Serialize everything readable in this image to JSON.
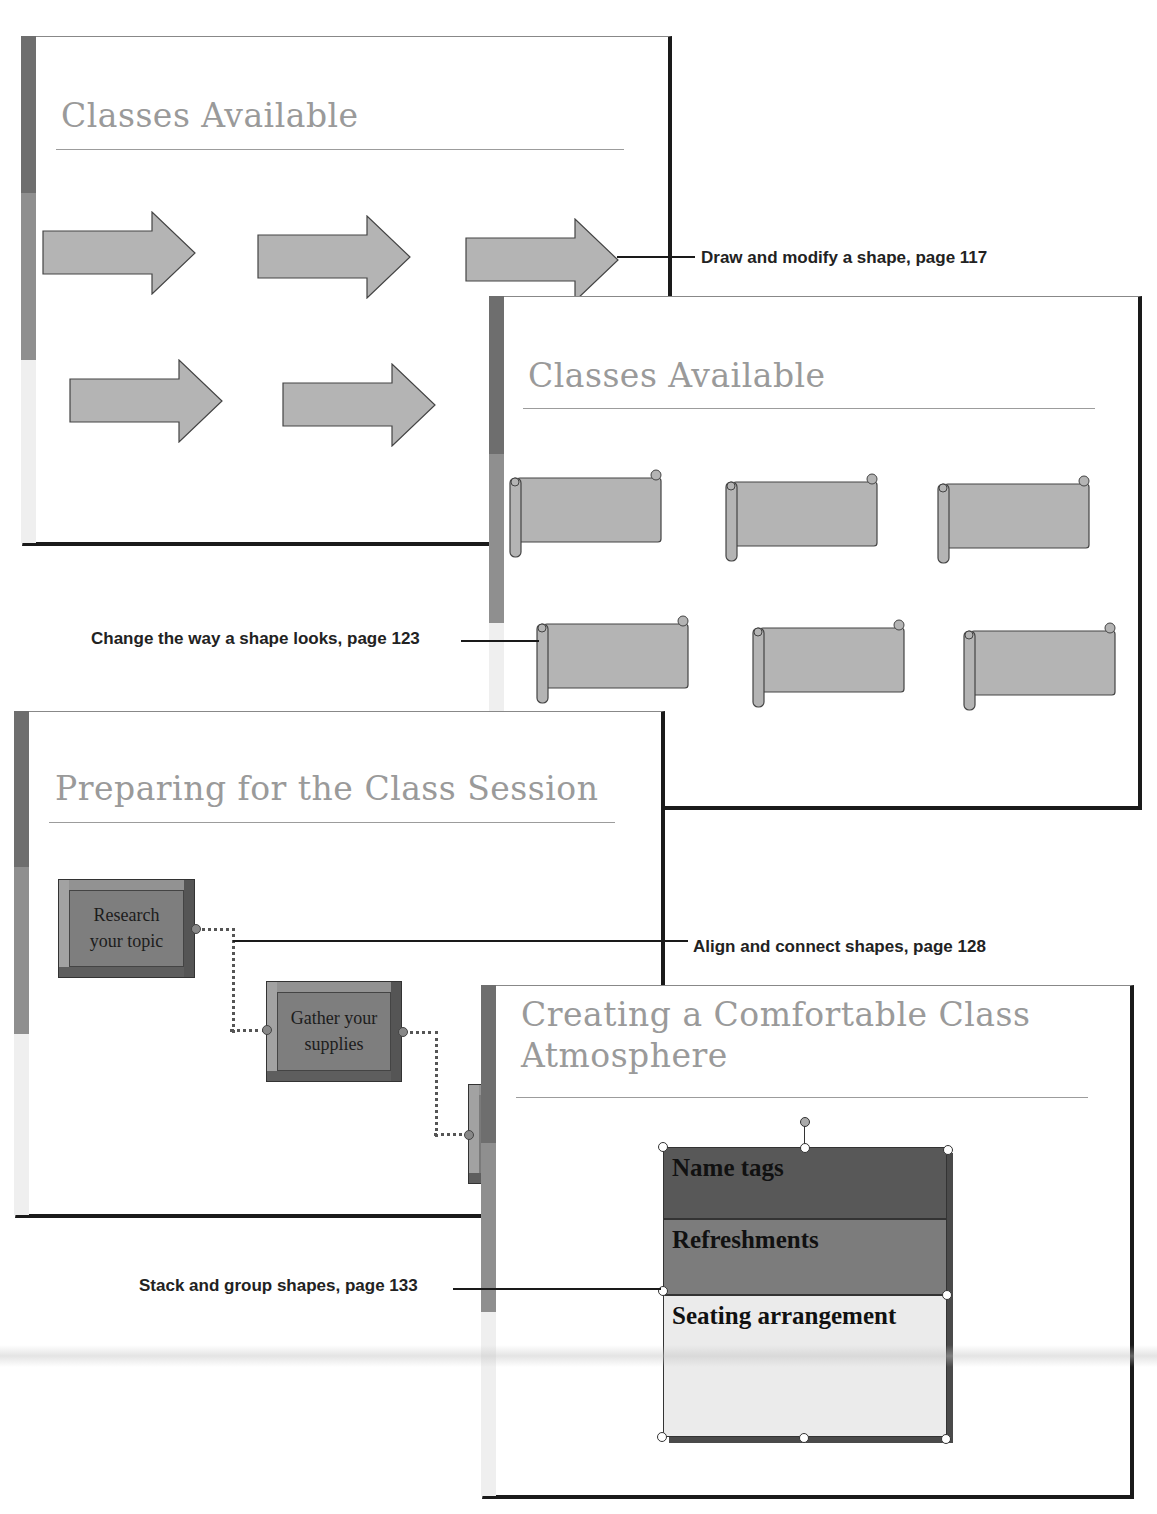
{
  "colors": {
    "accent_dark": "#6e6e6e",
    "accent_mid": "#8f8f8f",
    "accent_light": "#efefef",
    "shape_fill": "#b4b4b4",
    "title_text": "#9a9a9a",
    "group_row_1": "#585858",
    "group_row_2": "#7c7c7c",
    "group_row_3": "#ebebeb"
  },
  "slides": [
    {
      "id": "slide-arrows",
      "title": "Classes Available",
      "shape_type": "block-arrow",
      "shape_count": 5
    },
    {
      "id": "slide-scrolls",
      "title": "Classes Available",
      "shape_type": "horizontal-scroll",
      "shape_count": 6
    },
    {
      "id": "slide-flowchart",
      "title": "Preparing for the Class Session",
      "boxes": [
        {
          "label": "Research your topic"
        },
        {
          "label": "Gather your supplies"
        }
      ]
    },
    {
      "id": "slide-group",
      "title_line1": "Creating a Comfortable Class",
      "title_line2": "Atmosphere",
      "group_rows": [
        {
          "label": "Name tags"
        },
        {
          "label": "Refreshments"
        },
        {
          "label": "Seating arrangement"
        }
      ]
    }
  ],
  "callouts": [
    {
      "text": "Draw and modify a shape, page 117"
    },
    {
      "text": "Change the way a shape looks, page 123"
    },
    {
      "text": "Align and connect shapes, page 128"
    },
    {
      "text": "Stack and group shapes, page 133"
    }
  ]
}
